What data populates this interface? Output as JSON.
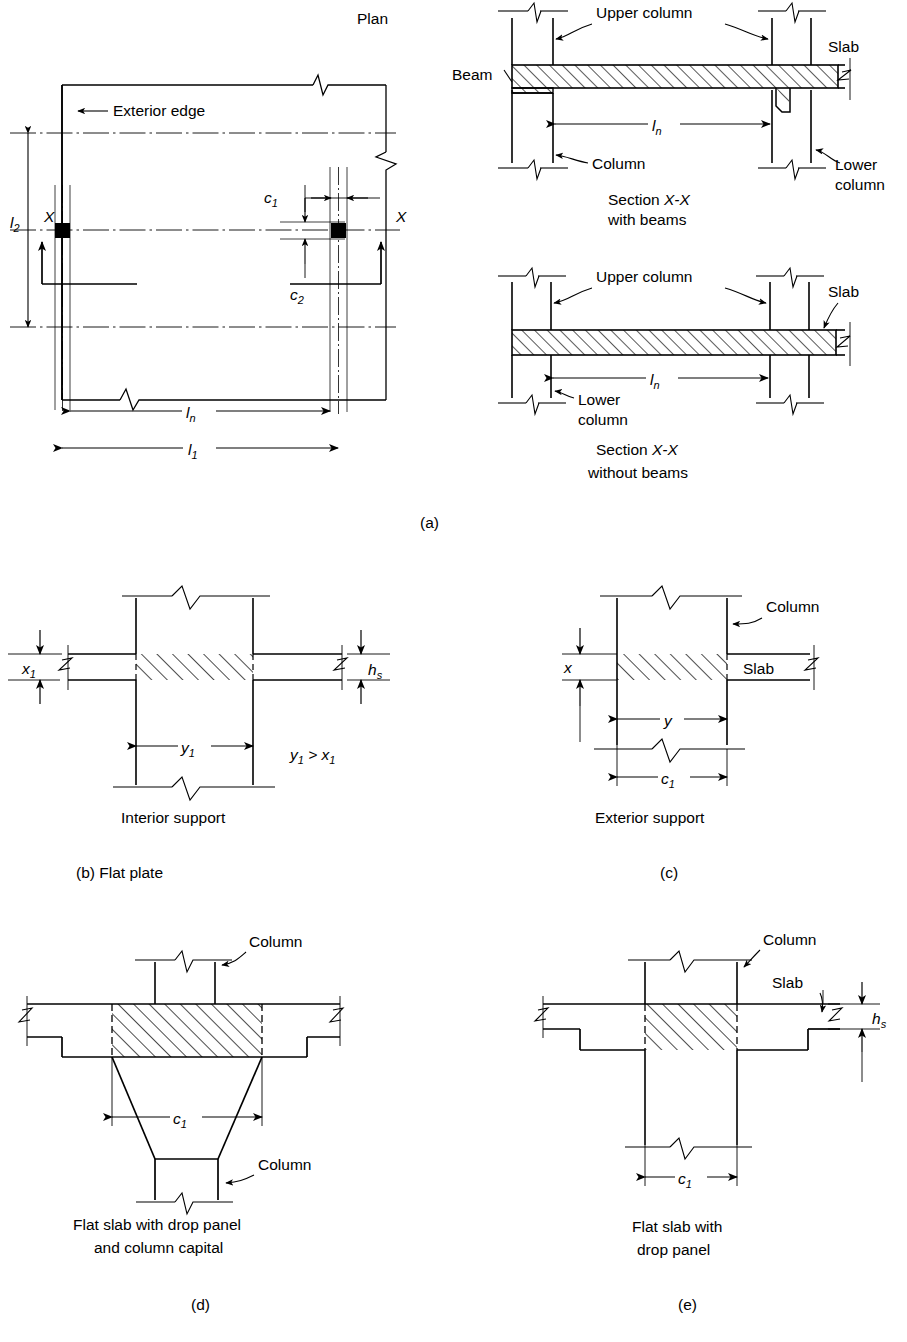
{
  "figure": {
    "title": "Plan",
    "panels": [
      {
        "id": "a",
        "label": "(a)",
        "plan": {
          "title": "Plan",
          "annotations": [
            {
              "name": "exterior-edge",
              "text": "Exterior edge"
            },
            {
              "name": "dim-l2",
              "text": "l",
              "subscript": "2"
            },
            {
              "name": "dim-c1",
              "text": "c",
              "subscript": "1"
            },
            {
              "name": "dim-c2",
              "text": "c",
              "subscript": "2"
            },
            {
              "name": "dim-ln",
              "text": "l",
              "subscript": "n"
            },
            {
              "name": "dim-l1",
              "text": "l",
              "subscript": "1"
            },
            {
              "name": "section-mark-left",
              "text": "X"
            },
            {
              "name": "section-mark-right",
              "text": "X"
            }
          ]
        },
        "section_with_beams": {
          "caption_line1": "Section X-X",
          "caption_line2": "with beams",
          "labels": [
            "Upper column",
            "Slab",
            "Beam",
            "Column",
            "Lower column"
          ],
          "dimension": {
            "text": "l",
            "subscript": "n"
          }
        },
        "section_without_beams": {
          "caption_line1": "Section X-X",
          "caption_line2": "without beams",
          "labels": [
            "Upper column",
            "Slab",
            "Lower column"
          ],
          "dimension": {
            "text": "l",
            "subscript": "n"
          }
        }
      },
      {
        "id": "b",
        "label": "(b) Flat plate",
        "caption": "Interior support",
        "dims": [
          {
            "text": "x",
            "subscript": "1"
          },
          {
            "text": "h",
            "subscript": "s"
          },
          {
            "text": "y",
            "subscript": "1"
          }
        ],
        "note": "y₁ > x₁",
        "note_parts": {
          "left": "y",
          "left_sub": "1",
          "op": ">",
          "right": "x",
          "right_sub": "1"
        }
      },
      {
        "id": "c",
        "label": "(c)",
        "caption": "Exterior support",
        "labels": [
          "Column",
          "Slab"
        ],
        "dims": [
          {
            "text": "x",
            "subscript": ""
          },
          {
            "text": "y",
            "subscript": ""
          },
          {
            "text": "c",
            "subscript": "1"
          }
        ]
      },
      {
        "id": "d",
        "label": "(d)",
        "caption_line1": "Flat slab with drop panel",
        "caption_line2": "and column capital",
        "labels": [
          "Column",
          "Column"
        ],
        "dims": [
          {
            "text": "c",
            "subscript": "1"
          }
        ]
      },
      {
        "id": "e",
        "label": "(e)",
        "caption_line1": "Flat slab with",
        "caption_line2": "drop panel",
        "labels": [
          "Column",
          "Slab"
        ],
        "dims": [
          {
            "text": "h",
            "subscript": "s"
          },
          {
            "text": "c",
            "subscript": "1"
          }
        ]
      }
    ],
    "colors": {
      "line": "#000000",
      "background": "#ffffff"
    }
  }
}
